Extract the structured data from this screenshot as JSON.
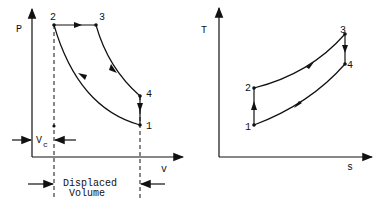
{
  "pv_diagram": {
    "y_axis_label": "P",
    "x_axis_label": "v",
    "points": [
      {
        "id": "1",
        "label": "1"
      },
      {
        "id": "2",
        "label": "2"
      },
      {
        "id": "3",
        "label": "3"
      },
      {
        "id": "4",
        "label": "4"
      }
    ],
    "clearance_label": "V",
    "clearance_subscript": "c",
    "displaced_label_line1": "Displaced",
    "displaced_label_line2": "Volume"
  },
  "ts_diagram": {
    "y_axis_label": "T",
    "x_axis_label": "s",
    "points": [
      {
        "id": "1",
        "label": "1"
      },
      {
        "id": "2",
        "label": "2"
      },
      {
        "id": "3",
        "label": "3"
      },
      {
        "id": "4",
        "label": "4"
      }
    ]
  }
}
